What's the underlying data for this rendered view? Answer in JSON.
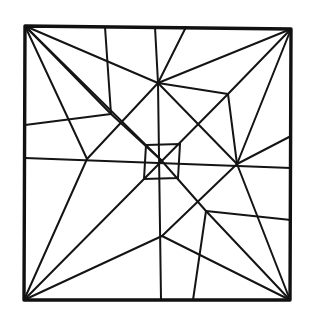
{
  "diagram": {
    "type": "crease-pattern",
    "line_color": "#141414",
    "background": "#ffffff",
    "outer_square": [
      [
        25,
        26
      ],
      [
        291,
        29
      ],
      [
        290,
        300
      ],
      [
        24,
        300
      ]
    ],
    "inner_square": [
      [
        146,
        145
      ],
      [
        180,
        144
      ],
      [
        178,
        178
      ],
      [
        144,
        179
      ]
    ],
    "nodes": {
      "TL": [
        25,
        26
      ],
      "TR": [
        291,
        29
      ],
      "BR": [
        290,
        300
      ],
      "BL": [
        24,
        300
      ],
      "C": [
        161,
        160
      ],
      "U": [
        158,
        83
      ],
      "R": [
        237,
        164
      ],
      "A": [
        111,
        114
      ],
      "B": [
        87,
        159
      ],
      "D": [
        228,
        94
      ],
      "E": [
        206,
        211
      ],
      "F": [
        162,
        236
      ],
      "G": [
        198,
        202
      ]
    },
    "lines": [
      [
        [
          25,
          26
        ],
        [
          158,
          83
        ]
      ],
      [
        [
          25,
          26
        ],
        [
          111,
          114
        ]
      ],
      [
        [
          25,
          26
        ],
        [
          161,
          160
        ]
      ],
      [
        [
          25,
          26
        ],
        [
          87,
          159
        ]
      ],
      [
        [
          105,
          27
        ],
        [
          111,
          114
        ]
      ],
      [
        [
          25,
          125
        ],
        [
          111,
          114
        ]
      ],
      [
        [
          111,
          114
        ],
        [
          161,
          160
        ]
      ],
      [
        [
          25,
          158
        ],
        [
          291,
          168
        ]
      ],
      [
        [
          87,
          159
        ],
        [
          158,
          83
        ]
      ],
      [
        [
          87,
          159
        ],
        [
          24,
          300
        ]
      ],
      [
        [
          155,
          27
        ],
        [
          158,
          83
        ]
      ],
      [
        [
          186,
          27
        ],
        [
          158,
          83
        ]
      ],
      [
        [
          158,
          83
        ],
        [
          291,
          29
        ]
      ],
      [
        [
          158,
          83
        ],
        [
          228,
          94
        ]
      ],
      [
        [
          158,
          83
        ],
        [
          161,
          300
        ]
      ],
      [
        [
          158,
          83
        ],
        [
          237,
          164
        ]
      ],
      [
        [
          228,
          94
        ],
        [
          291,
          29
        ]
      ],
      [
        [
          228,
          94
        ],
        [
          237,
          164
        ]
      ],
      [
        [
          228,
          94
        ],
        [
          144,
          179
        ]
      ],
      [
        [
          237,
          164
        ],
        [
          291,
          29
        ]
      ],
      [
        [
          237,
          164
        ],
        [
          291,
          136
        ]
      ],
      [
        [
          237,
          164
        ],
        [
          162,
          236
        ]
      ],
      [
        [
          237,
          164
        ],
        [
          290,
          300
        ]
      ],
      [
        [
          161,
          160
        ],
        [
          206,
          211
        ]
      ],
      [
        [
          206,
          211
        ],
        [
          291,
          220
        ]
      ],
      [
        [
          206,
          211
        ],
        [
          193,
          300
        ]
      ],
      [
        [
          206,
          211
        ],
        [
          290,
          300
        ]
      ],
      [
        [
          162,
          236
        ],
        [
          290,
          300
        ]
      ],
      [
        [
          162,
          236
        ],
        [
          24,
          300
        ]
      ],
      [
        [
          144,
          179
        ],
        [
          24,
          300
        ]
      ]
    ]
  }
}
